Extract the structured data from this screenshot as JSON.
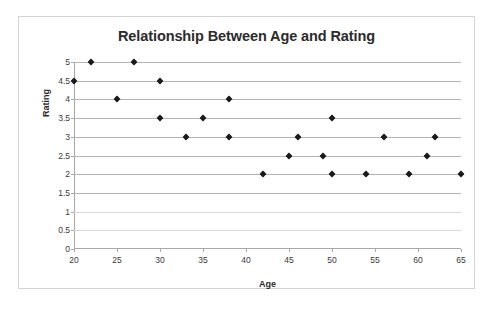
{
  "chart_data": {
    "type": "scatter",
    "title": "Relationship Between Age and Rating",
    "xlabel": "Age",
    "ylabel": "Rating",
    "xlim": [
      20,
      65
    ],
    "ylim": [
      0,
      5
    ],
    "xticks": [
      20,
      25,
      30,
      35,
      40,
      45,
      50,
      55,
      60,
      65
    ],
    "xtick_labels": [
      "20",
      "25",
      "30",
      "35",
      "40",
      "45",
      "50",
      "55",
      "60",
      "65"
    ],
    "yticks": [
      0,
      0.5,
      1,
      1.5,
      2,
      2.5,
      3,
      3.5,
      4,
      4.5,
      5
    ],
    "ytick_labels": [
      "0",
      "0.5",
      "1",
      "1.5",
      "2",
      "2.5",
      "3",
      "3.5",
      "4",
      "4.5",
      "5"
    ],
    "grid": true,
    "grid_axis": "y",
    "legend": false,
    "marker": "diamond",
    "marker_color": "#1a1a1a",
    "points": [
      {
        "x": 20,
        "y": 4.5
      },
      {
        "x": 22,
        "y": 5
      },
      {
        "x": 25,
        "y": 4
      },
      {
        "x": 27,
        "y": 5
      },
      {
        "x": 30,
        "y": 4.5
      },
      {
        "x": 30,
        "y": 3.5
      },
      {
        "x": 33,
        "y": 3
      },
      {
        "x": 35,
        "y": 3.5
      },
      {
        "x": 38,
        "y": 4
      },
      {
        "x": 38,
        "y": 3
      },
      {
        "x": 42,
        "y": 2
      },
      {
        "x": 45,
        "y": 2.5
      },
      {
        "x": 46,
        "y": 3
      },
      {
        "x": 49,
        "y": 2.5
      },
      {
        "x": 50,
        "y": 3.5
      },
      {
        "x": 50,
        "y": 2
      },
      {
        "x": 54,
        "y": 2
      },
      {
        "x": 56,
        "y": 3
      },
      {
        "x": 59,
        "y": 2
      },
      {
        "x": 61,
        "y": 2.5
      },
      {
        "x": 62,
        "y": 3
      },
      {
        "x": 65,
        "y": 2
      }
    ]
  }
}
